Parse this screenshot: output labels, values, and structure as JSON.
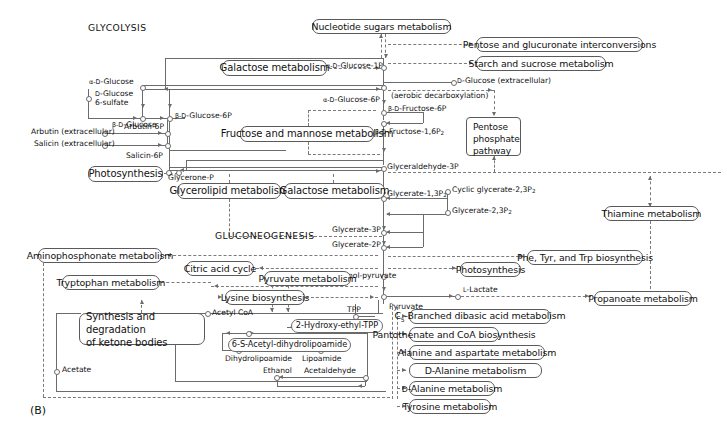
{
  "figure": {
    "panel_label": "(B)",
    "sections": [
      {
        "name": "glycolysis",
        "text": "GLYCOLYSIS",
        "x": 88,
        "y": 26
      },
      {
        "name": "gluconeogenesis",
        "text": "GLUCONEOGENESIS",
        "x": 215,
        "y": 234
      }
    ]
  },
  "pathway_boxes": [
    {
      "name": "nucleotide-sugars-metabolism",
      "label": "Nucleotide sugars metabolism",
      "x": 312,
      "y": 19,
      "w": 139,
      "h": 15
    },
    {
      "name": "pentose-and-glucuronate-interconversions",
      "label": "Pentose and glucuronate interconversions",
      "x": 476,
      "y": 37,
      "w": 167,
      "h": 15
    },
    {
      "name": "starch-and-sucrose-metabolism",
      "label": "Starch and sucrose metabolism",
      "x": 476,
      "y": 56,
      "w": 130,
      "h": 15
    },
    {
      "name": "galactose-metabolism-top",
      "label": "Galactose metabolism",
      "x": 222,
      "y": 60,
      "w": 105,
      "h": 16
    },
    {
      "name": "pentose-phosphate-pathway",
      "label": "Pentose\nphosphate\npathway",
      "x": 466,
      "y": 117,
      "w": 55,
      "h": 39
    },
    {
      "name": "fructose-and-mannose-metabolism",
      "label": "Fructose and mannose metabolism",
      "x": 240,
      "y": 126,
      "w": 134,
      "h": 16
    },
    {
      "name": "photosynthesis-left",
      "label": "Photosynthesis",
      "x": 88,
      "y": 166,
      "w": 75,
      "h": 16
    },
    {
      "name": "glycerolipid-metabolism",
      "label": "Glycerolipid metabolism",
      "x": 177,
      "y": 183,
      "w": 104,
      "h": 16
    },
    {
      "name": "galactose-metabolism-mid",
      "label": "Galactose metabolism",
      "x": 284,
      "y": 183,
      "w": 101,
      "h": 16
    },
    {
      "name": "thiamine-metabolism",
      "label": "Thiamine metabolism",
      "x": 604,
      "y": 206,
      "w": 95,
      "h": 15
    },
    {
      "name": "aminophosphonate-metabolism",
      "label": "Aminophosphonate metabolism",
      "x": 38,
      "y": 248,
      "w": 124,
      "h": 15
    },
    {
      "name": "phe-tyr-trp-biosynthesis",
      "label": "Phe, Tyr, and Trp biosynthesis",
      "x": 527,
      "y": 250,
      "w": 116,
      "h": 15
    },
    {
      "name": "citric-acid-cycle",
      "label": "Citric acid cycle",
      "x": 186,
      "y": 261,
      "w": 68,
      "h": 15
    },
    {
      "name": "photosynthesis-right",
      "label": "Photosynthesis",
      "x": 460,
      "y": 262,
      "w": 61,
      "h": 15
    },
    {
      "name": "pyruvate-metabolism",
      "label": "Pyruvate metabolism",
      "x": 264,
      "y": 271,
      "w": 87,
      "h": 15
    },
    {
      "name": "tryptophan-metabolism",
      "label": "Tryptophan metabolism",
      "x": 62,
      "y": 275,
      "w": 98,
      "h": 15
    },
    {
      "name": "lysine-biosynthesis",
      "label": "Lysine biosynthesis",
      "x": 225,
      "y": 290,
      "w": 80,
      "h": 15
    },
    {
      "name": "propanoate-metabolism",
      "label": "Propanoate metabolism",
      "x": 594,
      "y": 291,
      "w": 98,
      "h": 15
    },
    {
      "name": "c5-branched-dibasic-acid-metabolism",
      "label": "C5-Branched dibasic acid metabolism",
      "x": 409,
      "y": 309,
      "w": 142,
      "h": 15
    },
    {
      "name": "synthesis-and-degradation-of-ketone-bodies",
      "label": "Synthesis and degradation\nof ketone bodies",
      "x": 79,
      "y": 313,
      "w": 126,
      "h": 32
    },
    {
      "name": "butanoate-metabolism",
      "label": "Butanoate metabolism",
      "x": 409,
      "y": 327,
      "w": 90,
      "h": 15
    },
    {
      "name": "pantothenate-and-coa-biosynthesis",
      "label": "Pantothenate and CoA biosynthesis",
      "x": 409,
      "y": 345,
      "w": 136,
      "h": 15
    },
    {
      "name": "alanine-and-aspartate-metabolism",
      "label": "Alanine and aspartate metabolism",
      "x": 409,
      "y": 363,
      "w": 133,
      "h": 15
    },
    {
      "name": "d-alanine-metabolism",
      "label": "D-Alanine metabolism",
      "x": 409,
      "y": 381,
      "w": 86,
      "h": 15
    },
    {
      "name": "tyrosine-metabolism",
      "label": "Tyrosine metabolism",
      "x": 409,
      "y": 399,
      "w": 82,
      "h": 15
    }
  ],
  "compound_boxes": [
    {
      "name": "2-hydroxy-ethyl-tpp",
      "label": "2-Hydroxy-ethyl-TPP",
      "x": 291,
      "y": 319,
      "w": 92,
      "h": 14
    },
    {
      "name": "6-s-acetyl-dihydrolipoamide",
      "label": "6-S-Acetyl-dihydrolipoamide",
      "x": 228,
      "y": 338,
      "w": 123,
      "h": 14
    }
  ],
  "compound_labels": [
    {
      "name": "alpha-d-glucose",
      "label": "α-D-Glucose",
      "x": 89,
      "y": 82
    },
    {
      "name": "d-glucose-6-sulfate",
      "label": "D-Glucose\n6-sulfate",
      "x": 95,
      "y": 93
    },
    {
      "name": "beta-d-glucose",
      "label": "β-D-Glucose",
      "x": 112,
      "y": 118
    },
    {
      "name": "beta-d-glucose-6p",
      "label": "β-D-Glucose-6P",
      "x": 174,
      "y": 110
    },
    {
      "name": "arbutin-extracellular",
      "label": "Arbutin (extracellular)",
      "x": 31,
      "y": 130
    },
    {
      "name": "salicin-extracellular",
      "label": "Salicin (extracellular)",
      "x": 34,
      "y": 141
    },
    {
      "name": "arbutin-6p",
      "label": "Arbutin-6P",
      "x": 129,
      "y": 128
    },
    {
      "name": "salicin-6p",
      "label": "Salicin-6P",
      "x": 131,
      "y": 152
    },
    {
      "name": "alpha-d-glucose-1p",
      "label": "α-D-Glucose-1P",
      "x": 325,
      "y": 63
    },
    {
      "name": "alpha-d-glucose-6p",
      "label": "α-D-Glucose-6P",
      "x": 325,
      "y": 97
    },
    {
      "name": "d-glucose-extracellular",
      "label": "D-Glucose (extracellular)",
      "x": 455,
      "y": 78
    },
    {
      "name": "aerobic-decarboxylation",
      "label": "(aerobic decarboxylation)",
      "x": 391,
      "y": 96
    },
    {
      "name": "beta-d-fructose-6p",
      "label": "β-D-Fructose-6P",
      "x": 391,
      "y": 108
    },
    {
      "name": "beta-d-fructose-16p2",
      "label": "β-D-Fructose-1,6P2",
      "x": 378,
      "y": 131
    },
    {
      "name": "glyceraldehyde-3p",
      "label": "Glyceraldehyde-3P",
      "x": 384,
      "y": 157
    },
    {
      "name": "glycerone-p",
      "label": "Glycerone-P",
      "x": 170,
      "y": 172
    },
    {
      "name": "glycerate-13p2",
      "label": "Glycerate-1,3P2",
      "x": 386,
      "y": 190
    },
    {
      "name": "cyclic-glycerate-23p2",
      "label": "Cyclic glycerate-2,3P2",
      "x": 452,
      "y": 188
    },
    {
      "name": "glycerate-23p2",
      "label": "Glycerate-2,3P2",
      "x": 450,
      "y": 209
    },
    {
      "name": "glycerate-3p",
      "label": "Glycerate-3P",
      "x": 336,
      "y": 226
    },
    {
      "name": "glycerate-2p",
      "label": "Glycerate-2P",
      "x": 336,
      "y": 241
    },
    {
      "name": "phosphoenol-pyruvate",
      "label": "Phosphoenol-pyruvate",
      "x": 338,
      "y": 271
    },
    {
      "name": "pyruvate",
      "label": "Pyruvate",
      "x": 392,
      "y": 303
    },
    {
      "name": "l-lactate",
      "label": "L-Lactate",
      "x": 470,
      "y": 286
    },
    {
      "name": "acetyl-coa",
      "label": "Acetyl CoA",
      "x": 212,
      "y": 310
    },
    {
      "name": "tpp",
      "label": "TPP",
      "x": 347,
      "y": 310
    },
    {
      "name": "dihydrolipoamide",
      "label": "Dihydrolipoamide",
      "x": 229,
      "y": 355
    },
    {
      "name": "lipoamide",
      "label": "Lipoamide",
      "x": 302,
      "y": 355
    },
    {
      "name": "ethanol",
      "label": "Ethanol",
      "x": 265,
      "y": 369
    },
    {
      "name": "acetaldehyde",
      "label": "Acetaldehyde",
      "x": 306,
      "y": 369
    },
    {
      "name": "acetate",
      "label": "Acetate",
      "x": 62,
      "y": 367
    }
  ]
}
